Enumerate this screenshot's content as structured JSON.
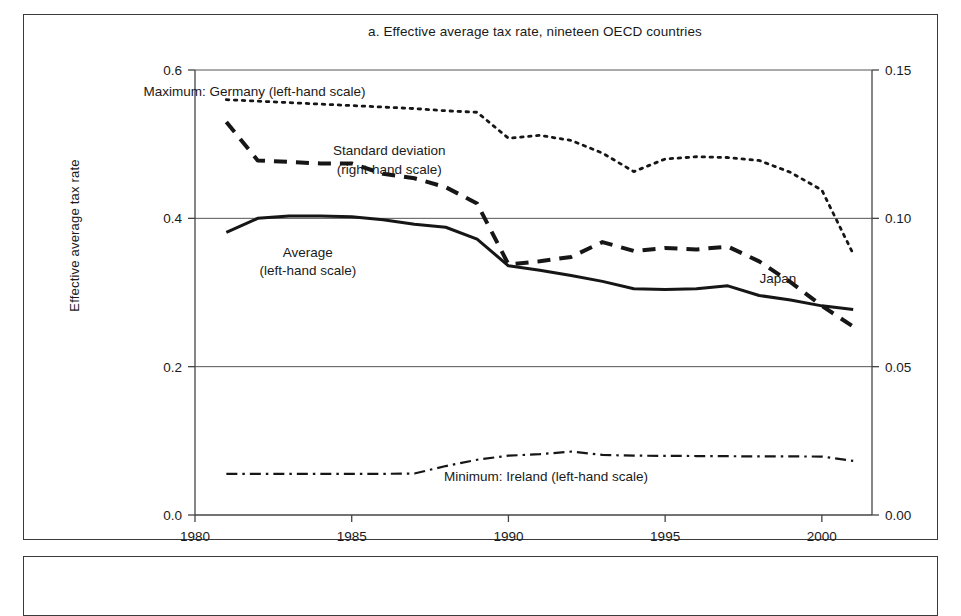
{
  "figure": {
    "title": "a. Effective average tax rate, nineteen OECD countries",
    "ylabel_left": "Effective average tax rate"
  },
  "chart_data": {
    "type": "line",
    "title": "a. Effective average tax rate, nineteen OECD countries",
    "xlabel": "",
    "ylabel": "Effective average tax rate",
    "ylabel_right": "",
    "xlim": [
      1980,
      2001.6
    ],
    "ylim": [
      0.0,
      0.6
    ],
    "ylim_right": [
      0.0,
      0.15
    ],
    "grid": true,
    "gridlines_left": [
      0.2,
      0.4
    ],
    "xticks": [
      1980,
      1985,
      1990,
      1995,
      2000
    ],
    "xticklabels": [
      "1980",
      "1985",
      "1990",
      "1995",
      "2000"
    ],
    "yticks_left": [
      0.0,
      0.2,
      0.4,
      0.6
    ],
    "yticklabels_left": [
      "0.0",
      "0.2",
      "0.4",
      "0.6"
    ],
    "yticks_right": [
      0.0,
      0.05,
      0.1,
      0.15
    ],
    "yticklabels_right": [
      "0.00",
      "0.05",
      "0.10",
      "0.15"
    ],
    "legend": "in-plot annotations",
    "annotations": [
      {
        "text": "Maximum: Germany (left-hand scale)",
        "x": 1981.9,
        "y": 0.572
      },
      {
        "text": "Standard deviation",
        "x": 1986.2,
        "y": 0.492
      },
      {
        "text": "(right-hand scale)",
        "x": 1986.2,
        "y": 0.466
      },
      {
        "text": "Average",
        "x": 1983.6,
        "y": 0.355
      },
      {
        "text": "(left-hand scale)",
        "x": 1983.6,
        "y": 0.33
      },
      {
        "text": "Japan",
        "x": 1998.6,
        "y": 0.32
      },
      {
        "text": "Minimum: Ireland (left-hand scale)",
        "x": 1991.2,
        "y": 0.052
      }
    ],
    "x": [
      1981,
      1982,
      1983,
      1984,
      1985,
      1986,
      1987,
      1988,
      1989,
      1990,
      1991,
      1992,
      1993,
      1994,
      1995,
      1996,
      1997,
      1998,
      1999,
      2000,
      2001
    ],
    "series": [
      {
        "name": "Maximum: Germany (left-hand scale)",
        "scale": "left",
        "style": "dotted",
        "values": [
          0.56,
          0.558,
          0.556,
          0.554,
          0.552,
          0.55,
          0.548,
          0.545,
          0.543,
          0.508,
          0.512,
          0.505,
          0.488,
          0.463,
          0.48,
          0.483,
          0.482,
          0.478,
          0.462,
          0.438,
          0.352
        ]
      },
      {
        "name": "Standard deviation (right-hand scale)",
        "scale": "right",
        "style": "dashed",
        "values": [
          0.1325,
          0.1195,
          0.119,
          0.1185,
          0.1185,
          0.115,
          0.1135,
          0.1105,
          0.105,
          0.0845,
          0.0855,
          0.087,
          0.092,
          0.089,
          0.09,
          0.0895,
          0.0905,
          0.0855,
          0.0785,
          0.0705,
          0.0635
        ]
      },
      {
        "name": "Average (left-hand scale)",
        "scale": "left",
        "style": "solid",
        "values": [
          0.381,
          0.4,
          0.403,
          0.403,
          0.402,
          0.398,
          0.392,
          0.388,
          0.372,
          0.336,
          0.33,
          0.323,
          0.315,
          0.305,
          0.304,
          0.305,
          0.309,
          0.296,
          0.29,
          0.282,
          0.277
        ]
      },
      {
        "name": "Minimum: Ireland (left-hand scale)",
        "scale": "left",
        "style": "dashdot",
        "values": [
          0.0555,
          0.0555,
          0.0555,
          0.0555,
          0.0555,
          0.0555,
          0.056,
          0.066,
          0.0745,
          0.08,
          0.082,
          0.0855,
          0.081,
          0.08,
          0.0798,
          0.0795,
          0.0793,
          0.079,
          0.079,
          0.0788,
          0.073
        ]
      }
    ]
  }
}
